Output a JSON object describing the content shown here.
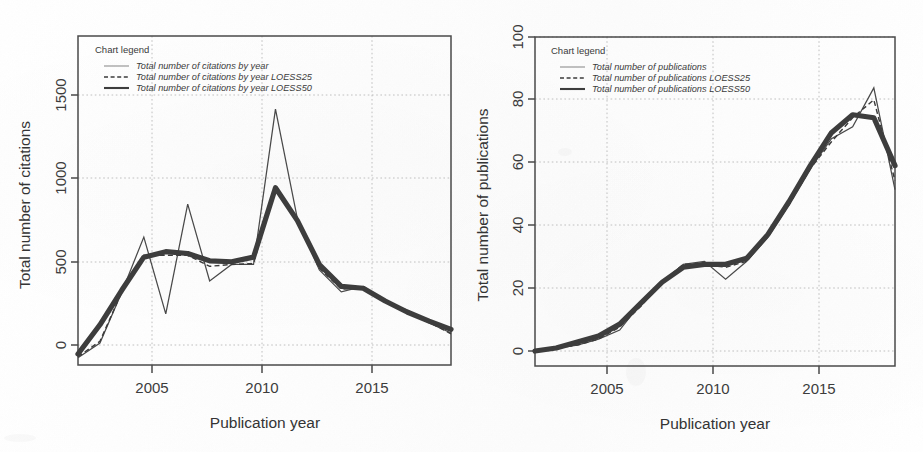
{
  "page": {
    "background_color": "#ffffff",
    "ink_color": "#3d3d3d",
    "grid_color": "#b9b9b9"
  },
  "charts": [
    {
      "id": "citations",
      "legend_title": "Chart legend",
      "legend": [
        {
          "label": "Total number of citations by year",
          "style": "thin-solid"
        },
        {
          "label": "Total number of citations by year LOESS25",
          "style": "dashed"
        },
        {
          "label": "Total number of citations by year LOESS50",
          "style": "thick-solid"
        }
      ],
      "xlabel": "Publication year",
      "ylabel": "Total number of citations",
      "xticks": [
        "2005",
        "2010",
        "2015"
      ],
      "yticks": [
        "0",
        "500",
        "1000",
        "1500"
      ]
    },
    {
      "id": "publications",
      "legend_title": "Chart legend",
      "legend": [
        {
          "label": "Total number of publications",
          "style": "thin-solid"
        },
        {
          "label": "Total number of publications LOESS25",
          "style": "dashed"
        },
        {
          "label": "Total number of publications LOESS50",
          "style": "thick-solid"
        }
      ],
      "xlabel": "Publication year",
      "ylabel": "Total number of publications",
      "xticks": [
        "2005",
        "2010",
        "2015"
      ],
      "yticks": [
        "0",
        "20",
        "40",
        "60",
        "80",
        "100"
      ]
    }
  ],
  "chart_data": [
    {
      "type": "line",
      "id": "citations",
      "title": "",
      "xlabel": "Publication year",
      "ylabel": "Total number of citations",
      "xlim": [
        2002,
        2019
      ],
      "ylim": [
        -100,
        1700
      ],
      "xticks": [
        2005,
        2010,
        2015
      ],
      "yticks": [
        0,
        500,
        1000,
        1500
      ],
      "grid": true,
      "legend_position": "top-left",
      "legend_title": "Chart legend",
      "x": [
        2002,
        2003,
        2004,
        2005,
        2006,
        2007,
        2008,
        2009,
        2010,
        2011,
        2012,
        2013,
        2014,
        2015,
        2016,
        2017,
        2018,
        2019
      ],
      "series": [
        {
          "name": "Total number of citations by year",
          "style": "thin-solid",
          "values": [
            -60,
            20,
            300,
            600,
            180,
            780,
            360,
            450,
            450,
            1300,
            700,
            420,
            300,
            330,
            250,
            200,
            130,
            75
          ]
        },
        {
          "name": "Total number of citations by year LOESS25",
          "style": "dashed",
          "values": [
            -55,
            30,
            300,
            500,
            500,
            500,
            440,
            450,
            455,
            880,
            700,
            430,
            315,
            325,
            245,
            195,
            135,
            70
          ]
        },
        {
          "name": "Total number of citations by year LOESS50",
          "style": "thick-solid",
          "values": [
            -40,
            120,
            310,
            490,
            520,
            510,
            470,
            465,
            490,
            870,
            690,
            450,
            330,
            320,
            250,
            190,
            140,
            95
          ]
        }
      ]
    },
    {
      "type": "line",
      "id": "publications",
      "title": "",
      "xlabel": "Publication year",
      "ylabel": "Total number of publications",
      "xlim": [
        2002,
        2019
      ],
      "ylim": [
        -4,
        106
      ],
      "xticks": [
        2005,
        2010,
        2015
      ],
      "yticks": [
        0,
        20,
        40,
        60,
        80,
        100
      ],
      "grid": true,
      "legend_position": "top-left",
      "legend_title": "Chart legend",
      "x": [
        2002,
        2003,
        2004,
        2005,
        2006,
        2007,
        2008,
        2009,
        2010,
        2011,
        2012,
        2013,
        2014,
        2015,
        2016,
        2017,
        2018,
        2019
      ],
      "series": [
        {
          "name": "Total number of publications",
          "style": "thin-solid",
          "values": [
            1,
            2,
            3,
            5,
            8,
            17,
            24,
            30,
            31,
            25,
            31,
            39,
            50,
            62,
            72,
            76,
            89,
            55
          ]
        },
        {
          "name": "Total number of publications LOESS25",
          "style": "dashed",
          "values": [
            1,
            2,
            3,
            5,
            9,
            16,
            24,
            30,
            30,
            29,
            31,
            40,
            50,
            62,
            71,
            79,
            85,
            58
          ]
        },
        {
          "name": "Total number of publications LOESS50",
          "style": "thick-solid",
          "values": [
            1,
            2,
            4,
            6,
            10,
            17,
            24,
            29,
            30,
            30,
            32,
            40,
            51,
            63,
            74,
            80,
            79,
            63
          ]
        }
      ]
    }
  ]
}
